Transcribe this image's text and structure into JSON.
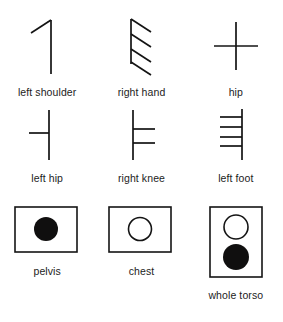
{
  "figure": {
    "background_color": "#ffffff",
    "ink_color": "#141414",
    "rows": [
      {
        "name": "upper-limb-symbols",
        "items": [
          {
            "label": "left shoulder",
            "glyph": "vertical-stroke-with-upper-left-diagonal",
            "tick_count": 1,
            "tick_side": "left",
            "tick_style": "diagonal"
          },
          {
            "label": "right hand",
            "glyph": "vertical-stroke-with-four-right-diagonals",
            "tick_count": 4,
            "tick_side": "right",
            "tick_style": "diagonal"
          },
          {
            "label": "hip",
            "glyph": "cross",
            "tick_count": 1,
            "tick_side": "both",
            "tick_style": "horizontal"
          }
        ]
      },
      {
        "name": "lower-limb-symbols",
        "items": [
          {
            "label": "left hip",
            "glyph": "vertical-stroke-with-one-left-horizontal",
            "tick_count": 1,
            "tick_side": "left",
            "tick_style": "horizontal"
          },
          {
            "label": "right knee",
            "glyph": "vertical-stroke-with-two-right-horizontals",
            "tick_count": 2,
            "tick_side": "right",
            "tick_style": "horizontal"
          },
          {
            "label": "left foot",
            "glyph": "vertical-stroke-with-four-left-horizontals",
            "tick_count": 4,
            "tick_side": "left",
            "tick_style": "horizontal"
          }
        ]
      },
      {
        "name": "torso-symbols",
        "items": [
          {
            "label": "pelvis",
            "glyph": "box-with-filled-circle",
            "box": "wide",
            "circles": [
              "filled"
            ]
          },
          {
            "label": "chest",
            "glyph": "box-with-open-circle",
            "box": "wide",
            "circles": [
              "open"
            ]
          },
          {
            "label": "whole torso",
            "glyph": "tall-box-with-open-and-filled-circle",
            "box": "tall",
            "circles": [
              "open",
              "filled"
            ]
          }
        ]
      }
    ]
  }
}
